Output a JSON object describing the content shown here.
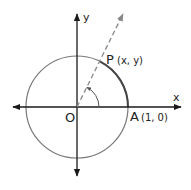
{
  "diagram": {
    "colors": {
      "background": "#ffffff",
      "axis": "#1a1a1a",
      "circle": "#777777",
      "highlight_arc": "#444444",
      "ray": "#888888",
      "text": "#222222"
    },
    "axes": {
      "x_label": "x",
      "y_label": "y"
    },
    "points": {
      "origin": {
        "label": "O"
      },
      "A": {
        "label": "A",
        "coords": "(1, 0)"
      },
      "P": {
        "label": "P",
        "coords": "(x, y)"
      }
    },
    "ray": {
      "style": "dashed",
      "angle_deg": 63
    },
    "angle_marker": {
      "type": "arc-with-arrow"
    }
  }
}
